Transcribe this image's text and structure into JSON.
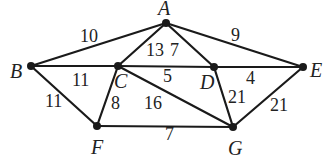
{
  "diagram": {
    "type": "weighted-undirected-graph",
    "nodes": [
      {
        "id": "A",
        "label": "A",
        "x": 166,
        "y": 23,
        "lx": 158,
        "ly": 15
      },
      {
        "id": "B",
        "label": "B",
        "x": 31,
        "y": 66,
        "lx": 10,
        "ly": 78
      },
      {
        "id": "C",
        "label": "C",
        "x": 118,
        "y": 66,
        "lx": 114,
        "ly": 88
      },
      {
        "id": "D",
        "label": "D",
        "x": 214,
        "y": 67,
        "lx": 200,
        "ly": 89
      },
      {
        "id": "E",
        "label": "E",
        "x": 303,
        "y": 67,
        "lx": 310,
        "ly": 77
      },
      {
        "id": "F",
        "label": "F",
        "x": 97,
        "y": 126,
        "lx": 91,
        "ly": 154
      },
      {
        "id": "G",
        "label": "G",
        "x": 233,
        "y": 127,
        "lx": 228,
        "ly": 155
      }
    ],
    "edges": [
      {
        "from": "A",
        "to": "B",
        "weight": "10",
        "lx": 80,
        "ly": 42
      },
      {
        "from": "A",
        "to": "C",
        "weight": "13",
        "lx": 146,
        "ly": 56
      },
      {
        "from": "A",
        "to": "D",
        "weight": "7",
        "lx": 170,
        "ly": 56
      },
      {
        "from": "A",
        "to": "E",
        "weight": "9",
        "lx": 231,
        "ly": 41
      },
      {
        "from": "B",
        "to": "C",
        "weight": "11",
        "lx": 72,
        "ly": 86
      },
      {
        "from": "C",
        "to": "D",
        "weight": "5",
        "lx": 163,
        "ly": 82
      },
      {
        "from": "D",
        "to": "E",
        "weight": "4",
        "lx": 246,
        "ly": 84
      },
      {
        "from": "B",
        "to": "F",
        "weight": "11",
        "lx": 45,
        "ly": 107
      },
      {
        "from": "C",
        "to": "F",
        "weight": "8",
        "lx": 111,
        "ly": 109
      },
      {
        "from": "C",
        "to": "G",
        "weight": "16",
        "lx": 144,
        "ly": 109
      },
      {
        "from": "D",
        "to": "G",
        "weight": "21",
        "lx": 228,
        "ly": 103
      },
      {
        "from": "E",
        "to": "G",
        "weight": "21",
        "lx": 270,
        "ly": 111
      },
      {
        "from": "F",
        "to": "G",
        "weight": "7",
        "lx": 165,
        "ly": 140
      }
    ]
  }
}
